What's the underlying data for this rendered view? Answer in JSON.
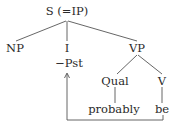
{
  "diagram": {
    "type": "syntax-tree",
    "nodes": {
      "root": "S (=IP)",
      "np": "NP",
      "infl": "I",
      "infl_feature": "−Pst",
      "vp": "VP",
      "qual": "Qual",
      "verb": "V",
      "qual_word": "probably",
      "verb_word": "be"
    },
    "edges": [
      [
        "S (=IP)",
        "NP"
      ],
      [
        "S (=IP)",
        "I"
      ],
      [
        "S (=IP)",
        "VP"
      ],
      [
        "VP",
        "Qual"
      ],
      [
        "VP",
        "V"
      ],
      [
        "Qual",
        "probably"
      ],
      [
        "V",
        "be"
      ]
    ],
    "movement_arrow": {
      "from": "be",
      "to": "−Pst"
    },
    "colors": {
      "text": "#2a2a2a",
      "lines": "#555555",
      "background": "#ffffff"
    }
  }
}
